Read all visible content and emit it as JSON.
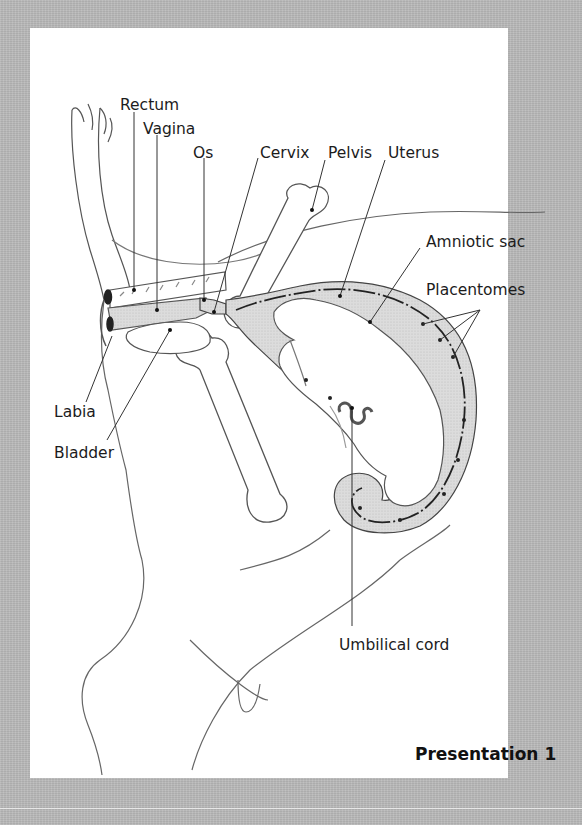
{
  "figure": {
    "title": "Presentation 1",
    "labels": {
      "rectum": "Rectum",
      "vagina": "Vagina",
      "os": "Os",
      "cervix": "Cervix",
      "pelvis": "Pelvis",
      "uterus": "Uterus",
      "amniotic_sac": "Amniotic sac",
      "placentomes": "Placentomes",
      "labia": "Labia",
      "bladder": "Bladder",
      "umbilical_cord": "Umbilical cord"
    },
    "colors": {
      "frame": "#b9b9b9",
      "panel": "#ffffff",
      "fluid_fill": "#d6d6d6",
      "line": "#3a3a3a"
    }
  }
}
